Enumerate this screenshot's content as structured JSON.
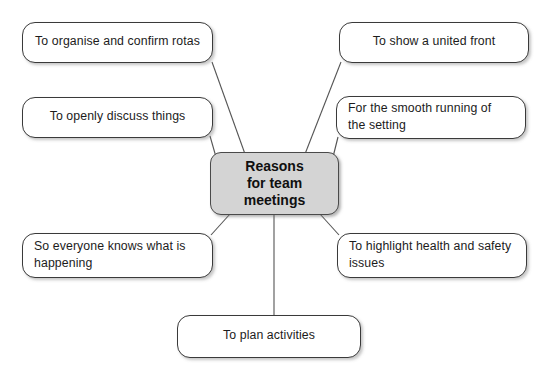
{
  "diagram": {
    "title": "Reasons for team meetings",
    "type": "mind-map",
    "center": {
      "label": "Reasons\nfor team\nmeetings",
      "fill": "#d4d4d4",
      "border": "#4a4a4a"
    },
    "leaves": [
      {
        "id": "tl",
        "label": "To organise and confirm rotas",
        "align": "center"
      },
      {
        "id": "ml",
        "label": "To openly discuss things",
        "align": "center"
      },
      {
        "id": "bl",
        "label": "So everyone knows what is\nhappening",
        "align": "left"
      },
      {
        "id": "tr",
        "label": "To show a united front",
        "align": "center"
      },
      {
        "id": "mr",
        "label": "For the smooth running of\nthe setting",
        "align": "left"
      },
      {
        "id": "br",
        "label": "To highlight health and safety\nissues",
        "align": "left"
      },
      {
        "id": "bc",
        "label": "To plan activities",
        "align": "center"
      }
    ],
    "colors": {
      "background": "#ffffff",
      "node_fill": "#ffffff",
      "node_border": "#3a3a3a",
      "connector": "#555555",
      "text": "#1c1c1c"
    },
    "connectors": [
      {
        "from": "tl",
        "to": "center"
      },
      {
        "from": "ml",
        "to": "center"
      },
      {
        "from": "bl",
        "to": "center"
      },
      {
        "from": "tr",
        "to": "center"
      },
      {
        "from": "mr",
        "to": "center"
      },
      {
        "from": "br",
        "to": "center"
      },
      {
        "from": "bc",
        "to": "center"
      }
    ]
  }
}
